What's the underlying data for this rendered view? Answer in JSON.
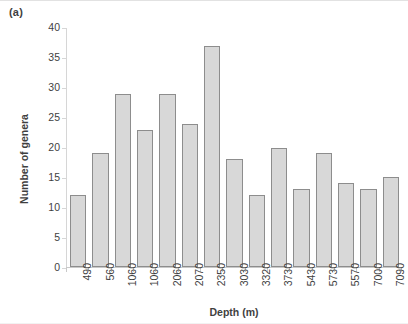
{
  "panel": {
    "label": "(a)"
  },
  "chart_data": {
    "type": "bar",
    "title": "",
    "subtitle": "",
    "xlabel": "Depth (m)",
    "ylabel": "Number of genera",
    "categories": [
      "490",
      "560",
      "1060",
      "1060",
      "2060",
      "2070",
      "2350",
      "3030",
      "3320",
      "3730",
      "5430",
      "5730",
      "5570",
      "7000",
      "7090"
    ],
    "values": [
      12,
      19,
      29,
      23,
      29,
      24,
      37,
      18,
      12,
      20,
      13,
      19,
      14,
      13,
      15
    ],
    "ylim": [
      0,
      40
    ],
    "yticks": [
      0,
      5,
      10,
      15,
      20,
      25,
      30,
      35,
      40
    ],
    "ytick_labels": [
      "0",
      "5",
      "10",
      "15",
      "20",
      "25",
      "30",
      "35",
      "40"
    ],
    "grid": false,
    "legend": false,
    "legend_position": "none",
    "bar_fill_color": "#d8d8d8",
    "bar_edge_color": "#8d8d8d",
    "axis_color": "#c9c9c9",
    "text_color": "#3f3f3f"
  }
}
